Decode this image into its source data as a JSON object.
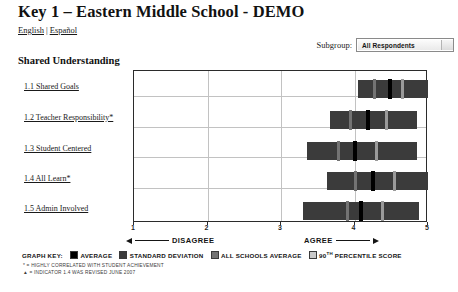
{
  "header": {
    "title": "Key 1 – Eastern Middle School - DEMO",
    "lang_english": "English",
    "lang_separator": "|",
    "lang_spanish": "Español"
  },
  "subgroup": {
    "label": "Subgroup:",
    "value": "All Respondents"
  },
  "section": {
    "title": "Shared Understanding"
  },
  "chart_data": {
    "type": "bar",
    "title": "Shared Understanding",
    "orientation": "horizontal",
    "xlabel": "",
    "ylabel": "",
    "xlim": [
      1,
      5
    ],
    "xticks": [
      1,
      2,
      3,
      4,
      5
    ],
    "xtick_labels": [
      "1",
      "2",
      "3",
      "4",
      "5"
    ],
    "grid": true,
    "legend_position": "bottom",
    "low_anchor": "DISAGREE",
    "high_anchor": "AGREE",
    "categories": [
      "1.1 Shared Goals",
      "1.2 Teacher Responsibility*",
      "1.3 Student Centered",
      "1.4 All Learn*",
      "1.5 Admin Involved"
    ],
    "series": [
      {
        "name": "STANDARD DEVIATION",
        "role": "range_bar",
        "values": [
          {
            "start": 4.05,
            "end": 5.0
          },
          {
            "start": 3.67,
            "end": 4.85
          },
          {
            "start": 3.35,
            "end": 4.85
          },
          {
            "start": 3.62,
            "end": 5.0
          },
          {
            "start": 3.3,
            "end": 4.88
          }
        ]
      },
      {
        "name": "AVERAGE",
        "role": "marker",
        "values": [
          4.47,
          4.18,
          4.0,
          4.25,
          4.08
        ]
      },
      {
        "name": "ALL SCHOOLS AVERAGE",
        "role": "marker",
        "values": [
          4.27,
          3.95,
          3.78,
          4.02,
          3.9
        ]
      },
      {
        "name": "90TH PERCENTILE SCORE",
        "role": "marker",
        "values": [
          4.65,
          4.43,
          4.3,
          4.55,
          4.38
        ]
      }
    ]
  },
  "legend": {
    "title": "GRAPH KEY:",
    "entries": [
      {
        "label": "AVERAGE",
        "color": "#000000"
      },
      {
        "label": "STANDARD DEVIATION",
        "color": "#3b3b3b"
      },
      {
        "label": "ALL SCHOOLS AVERAGE",
        "color": "#737373"
      },
      {
        "label": "90TH PERCENTILE SCORE",
        "color": "#c9c9c9"
      }
    ],
    "superscript_entry_index": 3,
    "superscript_text": "TH",
    "superscript_prefix": "90",
    "superscript_suffix": " PERCENTILE SCORE"
  },
  "footnotes": [
    "* = HIGHLY CORRELATED WITH STUDENT ACHIEVEMENT",
    "▲ = INDICATOR 1.4 WAS REVISED JUNE 2007"
  ]
}
